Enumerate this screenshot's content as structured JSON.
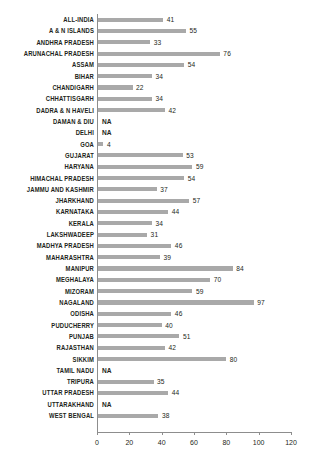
{
  "chart_data": {
    "type": "bar",
    "orientation": "horizontal",
    "title": "",
    "xlabel": "",
    "ylabel": "",
    "xlim": [
      0,
      120
    ],
    "xticks": [
      0,
      20,
      40,
      60,
      80,
      100,
      120
    ],
    "grid": false,
    "legend": null,
    "na_text": "NA",
    "bar_color": "#a9a9a9",
    "axis_color": "#8d8d8d",
    "text_color": "#231f20",
    "categories": [
      "ALL-INDIA",
      "A & N ISLANDS",
      "ANDHRA PRADESH",
      "ARUNACHAL PRADESH",
      "ASSAM",
      "BIHAR",
      "CHANDIGARH",
      "CHHATTISGARH",
      "DADRA & N HAVELI",
      "DAMAN & DIU",
      "DELHI",
      "GOA",
      "GUJARAT",
      "HARYANA",
      "HIMACHAL PRADESH",
      "JAMMU AND KASHMIR",
      "JHARKHAND",
      "KARNATAKA",
      "KERALA",
      "LAKSHWADEEP",
      "MADHYA PRADESH",
      "MAHARASHTRA",
      "MANIPUR",
      "MEGHALAYA",
      "MIZORAM",
      "NAGALAND",
      "ODISHA",
      "PUDUCHERRY",
      "PUNJAB",
      "RAJASTHAN",
      "SIKKIM",
      "TAMIL NADU",
      "TRIPURA",
      "UTTAR PRADESH",
      "UTTARAKHAND",
      "WEST BENGAL"
    ],
    "values": [
      41,
      55,
      33,
      76,
      54,
      34,
      22,
      34,
      42,
      null,
      null,
      4,
      53,
      59,
      54,
      37,
      57,
      44,
      34,
      31,
      46,
      39,
      84,
      70,
      59,
      97,
      46,
      40,
      51,
      42,
      80,
      null,
      35,
      44,
      null,
      38
    ],
    "labels": [
      "41",
      "55",
      "33",
      "76",
      "54",
      "34",
      "22",
      "34",
      "42",
      "NA",
      "NA",
      "4",
      "53",
      "59",
      "54",
      "37",
      "57",
      "44",
      "34",
      "31",
      "46",
      "39",
      "84",
      "70",
      "59",
      "97",
      "46",
      "40",
      "51",
      "42",
      "80",
      "NA",
      "35",
      "44",
      "NA",
      "38"
    ]
  }
}
